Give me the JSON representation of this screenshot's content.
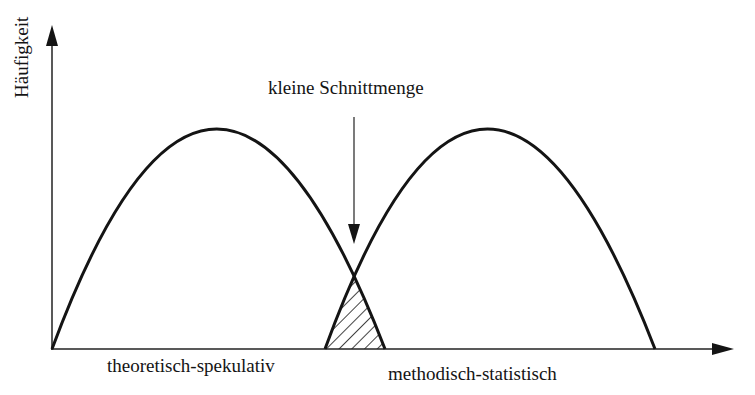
{
  "diagram": {
    "y_axis_label": "Häufigkeit",
    "annotation": "kleine Schnittmenge",
    "curves": [
      {
        "name": "theoretisch-spekulativ",
        "label": "theoretisch-spekulativ"
      },
      {
        "name": "methodisch-statistisch",
        "label": "methodisch-statistisch"
      }
    ],
    "overlap_region": "hatched",
    "colors": {
      "stroke": "#141414",
      "background": "#ffffff"
    }
  }
}
